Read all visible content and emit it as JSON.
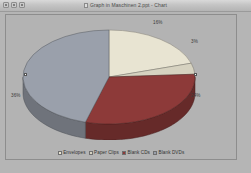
{
  "window": {
    "title": "Graph in Maschinen 2.ppt - Chart",
    "doc_icon": "document-icon",
    "controls": [
      {
        "name": "minimize",
        "glyph": "minimize-icon"
      },
      {
        "name": "maximize",
        "glyph": "maximize-icon"
      },
      {
        "name": "close",
        "glyph": "close-icon"
      }
    ]
  },
  "chart_data": {
    "type": "pie",
    "title": "",
    "subtitle": "",
    "xlabel": "",
    "ylabel": "",
    "three_d": true,
    "legend_position": "bottom",
    "grid": false,
    "categories": [
      "Envelopes",
      "Paper Clips",
      "Blank CDs",
      "Blank DVDs"
    ],
    "values": [
      16,
      3,
      24,
      36
    ],
    "labels": [
      "16%",
      "3%",
      "24%",
      "36%"
    ],
    "colors": [
      "#e8e4d2",
      "#d6d2c0",
      "#8d3a39",
      "#9aa0ab"
    ],
    "slices": [
      {
        "name": "Envelopes",
        "value": 16,
        "label": "16%",
        "color": "#e8e4d2"
      },
      {
        "name": "Paper Clips",
        "value": 3,
        "label": "3%",
        "color": "#d6d2c0"
      },
      {
        "name": "Blank CDs",
        "value": 24,
        "label": "24%",
        "color": "#8d3a39"
      },
      {
        "name": "Blank DVDs",
        "value": 36,
        "label": "36%",
        "color": "#9aa0ab"
      }
    ]
  },
  "legend": {
    "items": [
      {
        "label": "Envelopes",
        "color": "#e8e4d2"
      },
      {
        "label": "Paper Clips",
        "color": "#d6d2c0"
      },
      {
        "label": "Blank CDs",
        "color": "#8d3a39"
      },
      {
        "label": "Blank DVDs",
        "color": "#9aa0ab"
      }
    ]
  }
}
